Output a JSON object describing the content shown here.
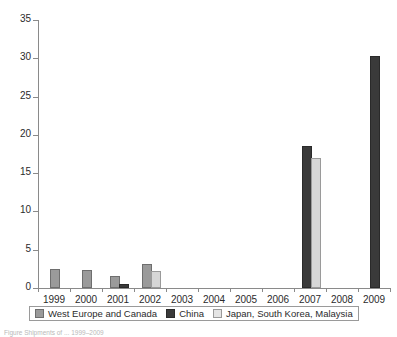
{
  "chart_data": {
    "type": "bar",
    "title": "",
    "subtitle": "",
    "xlabel": "",
    "ylabel": "",
    "categories": [
      "1999",
      "2000",
      "2001",
      "2002",
      "2003",
      "2004",
      "2005",
      "2006",
      "2007",
      "2008",
      "2009"
    ],
    "series": [
      {
        "name": "West Europe and Canada",
        "color": "#9a9a9a",
        "values": [
          2.2,
          2.1,
          1.3,
          2.9,
          0,
          0,
          0,
          0,
          0,
          0,
          0
        ]
      },
      {
        "name": "China",
        "color": "#3a3a3a",
        "values": [
          0,
          0,
          0.2,
          0,
          0,
          0,
          0,
          0,
          18.3,
          0,
          30.0
        ]
      },
      {
        "name": "Japan, South Korea, Malaysia",
        "color": "#d6d6d6",
        "values": [
          0,
          0,
          0,
          1.9,
          0,
          0,
          0,
          0,
          16.7,
          0,
          0
        ]
      }
    ],
    "ylim": [
      0,
      35
    ],
    "yticks": [
      0,
      5,
      10,
      15,
      20,
      25,
      30,
      35
    ],
    "ytick_labels": [
      "0",
      "5",
      "10",
      "15",
      "20",
      "25",
      "30",
      "35"
    ],
    "grid": false,
    "legend_position": "bottom"
  },
  "legend": {
    "items": [
      {
        "label": "West Europe and Canada",
        "swatch": "s0"
      },
      {
        "label": "China",
        "swatch": "s1"
      },
      {
        "label": "Japan, South Korea, Malaysia",
        "swatch": "s2"
      }
    ]
  },
  "caption": {
    "text": "Figure  Shipments of ... 1999–2009"
  }
}
